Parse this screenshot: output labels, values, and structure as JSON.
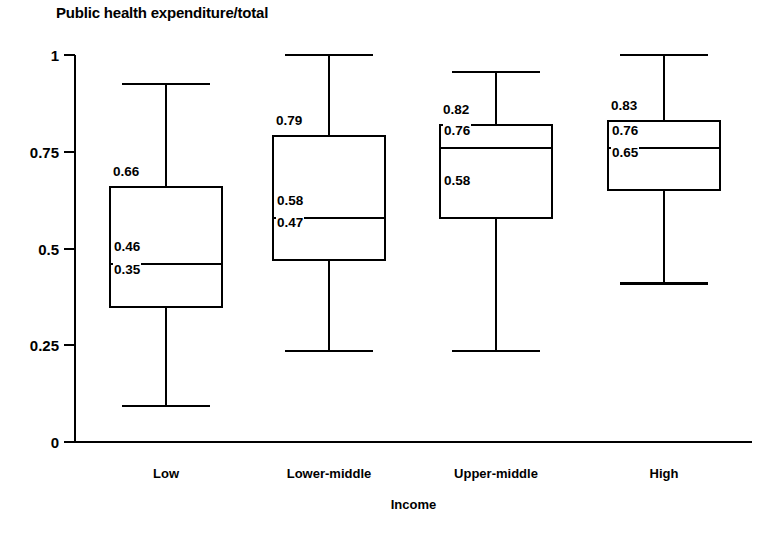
{
  "chart_data": {
    "type": "box",
    "title": "Public health expenditure/total",
    "xlabel": "Income",
    "ylabel": "",
    "ylim": [
      0,
      1
    ],
    "grid": false,
    "legend": false,
    "yticks": [
      "0",
      "0.25",
      "0.5",
      "0.75",
      "1"
    ],
    "ytick_values": [
      0,
      0.25,
      0.5,
      0.75,
      1
    ],
    "categories": [
      "Low",
      "Lower-middle",
      "Upper-middle",
      "High"
    ],
    "boxes": [
      {
        "category": "Low",
        "whisker_low": 0.093,
        "q1": 0.35,
        "median": 0.46,
        "q3": 0.66,
        "whisker_high": 0.925,
        "labels": {
          "q3": "0.66",
          "median": "0.46",
          "q1": "0.35"
        }
      },
      {
        "category": "Lower-middle",
        "whisker_low": 0.235,
        "q1": 0.47,
        "median": 0.58,
        "q3": 0.79,
        "whisker_high": 1.0,
        "labels": {
          "q3": "0.79",
          "median": "0.58",
          "q1": "0.47"
        }
      },
      {
        "category": "Upper-middle",
        "whisker_low": 0.235,
        "q1": 0.58,
        "median": 0.76,
        "q3": 0.82,
        "whisker_high": 0.956,
        "labels": {
          "q3": "0.82",
          "median": "0.76",
          "q1": "0.58"
        }
      },
      {
        "category": "High",
        "whisker_low": 0.41,
        "q1": 0.65,
        "median": 0.76,
        "q3": 0.83,
        "whisker_high": 1.0,
        "labels": {
          "q3": "0.83",
          "median": "0.76",
          "q1": "0.65"
        }
      }
    ]
  }
}
